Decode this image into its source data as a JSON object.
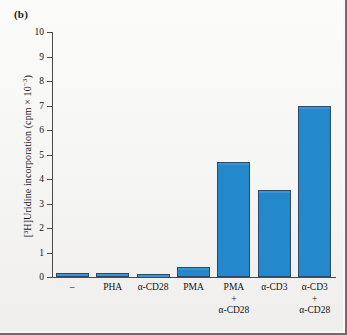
{
  "panel": {
    "letter": "(b)"
  },
  "chart_data": {
    "type": "bar",
    "title": "",
    "xlabel": "",
    "ylabel": "[³H]Uridine incorporation (cpm × 10⁻³)",
    "ylabel_main": "[³H]Uridine incorporation (cpm × 10",
    "ylabel_exp": "−3",
    "ylabel_tail": ")",
    "ylim": [
      0,
      10
    ],
    "yticks": [
      0,
      1,
      2,
      3,
      4,
      5,
      6,
      7,
      8,
      9,
      10
    ],
    "ytick_labels": [
      "0",
      "1",
      "2",
      "3",
      "4",
      "5",
      "6",
      "7",
      "8",
      "9",
      "10"
    ],
    "grid": false,
    "legend": "none",
    "bar_color": "#2489cc",
    "bar_edge_color": "#2f4a63",
    "categories": [
      "–",
      "PHA",
      "α-CD28",
      "PMA",
      "PMA + α-CD28",
      "α-CD3",
      "α-CD3 + α-CD28"
    ],
    "category_lines": [
      [
        "–"
      ],
      [
        "PHA"
      ],
      [
        "α-CD28"
      ],
      [
        "PMA"
      ],
      [
        "PMA",
        "+",
        "α-CD28"
      ],
      [
        "α-CD3"
      ],
      [
        "α-CD3",
        "+",
        "α-CD28"
      ]
    ],
    "values": [
      0.15,
      0.15,
      0.12,
      0.4,
      4.7,
      3.55,
      7.0
    ]
  }
}
